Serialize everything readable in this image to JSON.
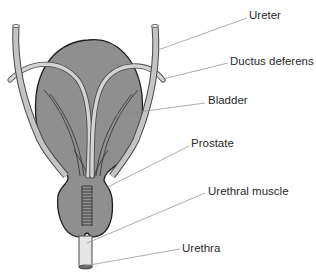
{
  "diagram": {
    "type": "anatomical-illustration",
    "colors": {
      "organ_fill": "#8f8f8f",
      "organ_outline": "#1e1e1e",
      "tube_fill": "#d4d4d4",
      "tube_outline": "#4a4a4a",
      "leader_line": "#8a8a8a",
      "label_text": "#2a2a2a",
      "background": "#ffffff"
    },
    "labels": [
      {
        "id": "ureter",
        "text": "Ureter",
        "x": 249,
        "y": 15
      },
      {
        "id": "ductus-deferens",
        "text": "Ductus deferens",
        "x": 230,
        "y": 60
      },
      {
        "id": "bladder",
        "text": "Bladder",
        "x": 208,
        "y": 96
      },
      {
        "id": "prostate",
        "text": "Prostate",
        "x": 191,
        "y": 139
      },
      {
        "id": "urethral-muscle",
        "text": "Urethral muscle",
        "x": 208,
        "y": 186
      },
      {
        "id": "urethra",
        "text": "Urethra",
        "x": 182,
        "y": 243
      }
    ]
  }
}
